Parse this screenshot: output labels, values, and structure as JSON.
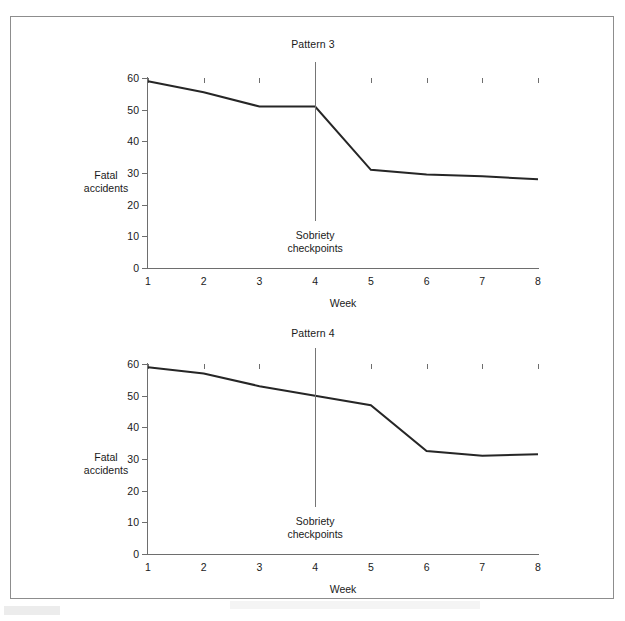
{
  "figure": {
    "panels": [
      {
        "id": "pattern3",
        "title": "Pattern 3",
        "ylabel_line1": "Fatal",
        "ylabel_line2": "accidents",
        "xlabel": "Week",
        "annotation_line1": "Sobriety",
        "annotation_line2": "checkpoints"
      },
      {
        "id": "pattern4",
        "title": "Pattern 4",
        "ylabel_line1": "Fatal",
        "ylabel_line2": "accidents",
        "xlabel": "Week",
        "annotation_line1": "Sobriety",
        "annotation_line2": "checkpoints"
      }
    ],
    "y_ticks": [
      "0",
      "10",
      "20",
      "30",
      "40",
      "50",
      "60"
    ],
    "x_ticks": [
      "1",
      "2",
      "3",
      "4",
      "5",
      "6",
      "7",
      "8"
    ],
    "line_color": "#262626",
    "axis_color": "#6e6e6e",
    "frame_color": "#8d8d8d"
  },
  "chart_data": [
    {
      "type": "line",
      "title": "Pattern 3",
      "xlabel": "Week",
      "ylabel": "Fatal accidents",
      "x": [
        1,
        2,
        3,
        4,
        5,
        6,
        7,
        8
      ],
      "categories": [
        "1",
        "2",
        "3",
        "4",
        "5",
        "6",
        "7",
        "8"
      ],
      "values": [
        59,
        55.5,
        51,
        51,
        31,
        29.5,
        29,
        28
      ],
      "xlim": [
        1,
        8
      ],
      "ylim": [
        0,
        60
      ],
      "ytick_values": [
        0,
        10,
        20,
        30,
        40,
        50,
        60
      ],
      "grid": false,
      "legend": "none",
      "annotations": [
        {
          "text": "Sobriety checkpoints",
          "type": "vertical-intervention-line",
          "x": 4,
          "y_from": 15,
          "y_to": 65
        }
      ]
    },
    {
      "type": "line",
      "title": "Pattern 4",
      "xlabel": "Week",
      "ylabel": "Fatal accidents",
      "x": [
        1,
        2,
        3,
        4,
        5,
        6,
        7,
        8
      ],
      "categories": [
        "1",
        "2",
        "3",
        "4",
        "5",
        "6",
        "7",
        "8"
      ],
      "values": [
        59,
        57,
        53,
        50,
        47,
        32.5,
        31,
        31.5
      ],
      "xlim": [
        1,
        8
      ],
      "ylim": [
        0,
        60
      ],
      "ytick_values": [
        0,
        10,
        20,
        30,
        40,
        50,
        60
      ],
      "grid": false,
      "legend": "none",
      "annotations": [
        {
          "text": "Sobriety checkpoints",
          "type": "vertical-intervention-line",
          "x": 4,
          "y_from": 15,
          "y_to": 65
        }
      ]
    }
  ]
}
